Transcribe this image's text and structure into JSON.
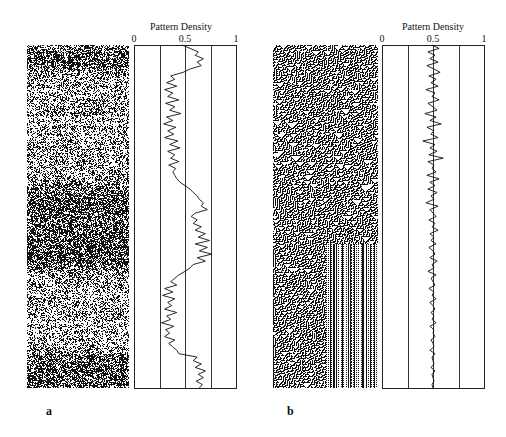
{
  "figure": {
    "panels": [
      {
        "id": "a",
        "label": "a",
        "pattern_type": "random"
      },
      {
        "id": "b",
        "label": "b",
        "pattern_type": "cellular-automaton"
      }
    ]
  },
  "chart_data": [
    {
      "type": "line",
      "panel": "a",
      "title": "Pattern Density",
      "xlabel": "",
      "ylabel": "",
      "orientation": "vertical (density on x-axis, row position top-to-bottom)",
      "xlim": [
        0,
        1
      ],
      "x_ticks": [
        "0",
        "0.5",
        "1"
      ],
      "gridlines_x": [
        0.25,
        0.5,
        0.75
      ],
      "grid": true,
      "values": [
        0.47,
        0.55,
        0.63,
        0.6,
        0.68,
        0.62,
        0.66,
        0.55,
        0.48,
        0.36,
        0.4,
        0.32,
        0.42,
        0.3,
        0.38,
        0.33,
        0.44,
        0.31,
        0.4,
        0.35,
        0.46,
        0.32,
        0.38,
        0.29,
        0.41,
        0.33,
        0.39,
        0.3,
        0.43,
        0.35,
        0.45,
        0.33,
        0.4,
        0.36,
        0.44,
        0.34,
        0.41,
        0.38,
        0.4,
        0.42,
        0.45,
        0.5,
        0.55,
        0.58,
        0.62,
        0.64,
        0.68,
        0.66,
        0.72,
        0.6,
        0.56,
        0.62,
        0.58,
        0.66,
        0.6,
        0.7,
        0.63,
        0.74,
        0.6,
        0.72,
        0.64,
        0.76,
        0.62,
        0.7,
        0.58,
        0.55,
        0.5,
        0.44,
        0.4,
        0.36,
        0.42,
        0.3,
        0.38,
        0.28,
        0.4,
        0.33,
        0.37,
        0.3,
        0.42,
        0.32,
        0.36,
        0.27,
        0.39,
        0.31,
        0.35,
        0.3,
        0.4,
        0.34,
        0.38,
        0.42,
        0.44,
        0.62,
        0.58,
        0.66,
        0.6,
        0.7,
        0.63,
        0.68,
        0.61,
        0.67,
        0.64
      ]
    },
    {
      "type": "line",
      "panel": "b",
      "title": "Pattern Density",
      "xlabel": "",
      "ylabel": "",
      "orientation": "vertical (density on x-axis, row position top-to-bottom)",
      "xlim": [
        0,
        1
      ],
      "x_ticks": [
        "0",
        "0.5",
        "1"
      ],
      "gridlines_x": [
        0.25,
        0.5,
        0.75
      ],
      "grid": true,
      "values": [
        0.49,
        0.56,
        0.45,
        0.52,
        0.47,
        0.55,
        0.44,
        0.51,
        0.57,
        0.46,
        0.53,
        0.48,
        0.55,
        0.43,
        0.52,
        0.49,
        0.56,
        0.45,
        0.5,
        0.54,
        0.42,
        0.53,
        0.47,
        0.58,
        0.44,
        0.51,
        0.48,
        0.55,
        0.4,
        0.52,
        0.47,
        0.54,
        0.46,
        0.6,
        0.45,
        0.51,
        0.49,
        0.53,
        0.44,
        0.56,
        0.47,
        0.52,
        0.45,
        0.54,
        0.48,
        0.51,
        0.43,
        0.55,
        0.47,
        0.5,
        0.53,
        0.46,
        0.52,
        0.49,
        0.55,
        0.47,
        0.51,
        0.48,
        0.53,
        0.46,
        0.5,
        0.52,
        0.47,
        0.54,
        0.49,
        0.51,
        0.45,
        0.53,
        0.48,
        0.5,
        0.52,
        0.46,
        0.51,
        0.49,
        0.53,
        0.47,
        0.5,
        0.52,
        0.48,
        0.51,
        0.49,
        0.53,
        0.47,
        0.51,
        0.5,
        0.52,
        0.48,
        0.5,
        0.51,
        0.47,
        0.52,
        0.49,
        0.5,
        0.51,
        0.48,
        0.52,
        0.49,
        0.5,
        0.51,
        0.49,
        0.5
      ]
    }
  ]
}
